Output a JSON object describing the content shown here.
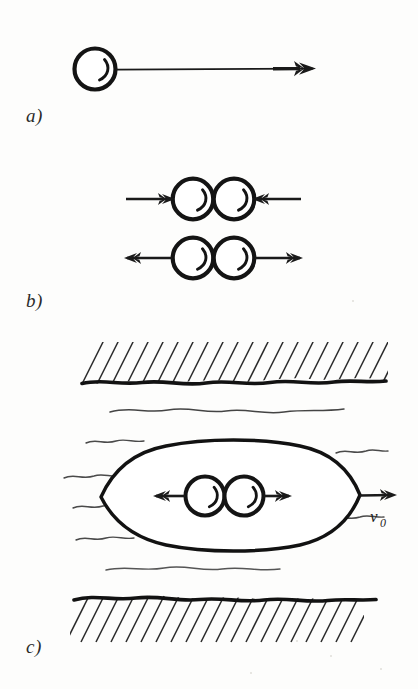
{
  "figure": {
    "kind": "line-diagram",
    "background_color": "#fdfdfc",
    "ink_color": "#1a1a1a",
    "width": 418,
    "height": 689,
    "panels": [
      {
        "id": "a",
        "label": "a)",
        "caption_text": "a)",
        "description": "Single sphere with a long horizontal arrow pointing right",
        "sphere_count": 1,
        "arrow_directions": [
          "right"
        ]
      },
      {
        "id": "b",
        "label": "b)",
        "caption_text": "b)",
        "description": "Two touching spheres shown twice: upper row with arrows pointing inward, lower row with arrows pointing outward",
        "sphere_count": 4,
        "rows": [
          {
            "name": "compression-row",
            "arrow_directions": [
              "right",
              "left"
            ]
          },
          {
            "name": "expansion-row",
            "arrow_directions": [
              "left",
              "right"
            ]
          }
        ]
      },
      {
        "id": "c",
        "label": "c)",
        "caption_text": "c)",
        "description": "Channel with hatched upper and lower walls, wavy fluid lines, and a lens-shaped cavity containing two touching spheres with outward arrows; an arrow labelled v0 exits to the right",
        "sphere_count": 2,
        "arrow_directions": [
          "left",
          "right",
          "right"
        ],
        "velocity_label": "v",
        "velocity_subscript": "0"
      }
    ]
  },
  "annotations": {
    "velocity_symbol": "v",
    "velocity_subscript": "0"
  }
}
